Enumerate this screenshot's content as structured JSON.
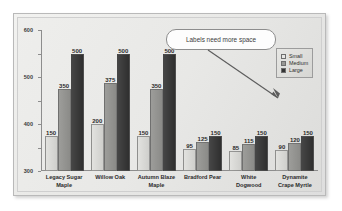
{
  "callout": {
    "text": "Labels need more space",
    "arrow_icon": "arrow-down-right-icon"
  },
  "legend": {
    "position": "top-right",
    "items": [
      {
        "label": "Small",
        "color": "#e6e6e3"
      },
      {
        "label": "Medium",
        "color": "#979794"
      },
      {
        "label": "Large",
        "color": "#343434"
      }
    ]
  },
  "axis": {
    "y_ticks": [
      "0",
      "100",
      "200",
      "300",
      "400",
      "500",
      "600"
    ]
  },
  "chart_data": {
    "type": "bar",
    "title": "",
    "subtitle": "",
    "xlabel": "",
    "ylabel": "",
    "ylim": [
      0,
      600
    ],
    "ytick_step": 100,
    "grid": false,
    "legend_position": "top-right",
    "categories": [
      "Legacy Sugar Maple",
      "Willow Oak",
      "Autumn Blaze Maple",
      "Bradford Pear",
      "White Dogwood",
      "Dynamite Crape Myrtle"
    ],
    "category_lines": [
      [
        "Legacy Sugar",
        "Maple"
      ],
      [
        "Willow Oak"
      ],
      [
        "Autumn Blaze",
        "Maple"
      ],
      [
        "Bradford Pear"
      ],
      [
        "White",
        "Dogwood"
      ],
      [
        "Dynamite",
        "Crape Myrtle"
      ]
    ],
    "series": [
      {
        "name": "Small",
        "color": "#e6e6e3",
        "values": [
          150,
          200,
          150,
          95,
          85,
          90
        ]
      },
      {
        "name": "Medium",
        "color": "#979794",
        "values": [
          350,
          375,
          350,
          125,
          115,
          120
        ]
      },
      {
        "name": "Large",
        "color": "#343434",
        "values": [
          500,
          500,
          500,
          150,
          150,
          150
        ]
      }
    ],
    "annotations": [
      {
        "text": "Labels need more space",
        "kind": "callout"
      }
    ]
  }
}
